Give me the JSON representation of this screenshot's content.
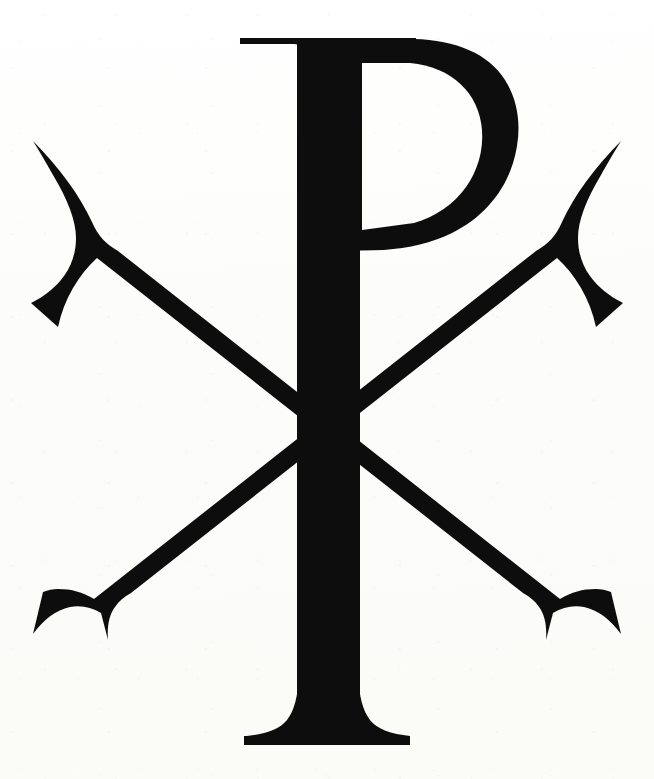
{
  "image": {
    "title": "Chi Rho (Christogram)",
    "alt_text": "Chi Rho monogram symbol",
    "background_color": "#fdfdfb",
    "ink_color": "#0d0d0d",
    "width": 654,
    "height": 779,
    "caption": ""
  },
  "glyph": {
    "name": "chi-rho",
    "description": "Serif Chi Rho monogram: letter P (rho) with vertical stem and bowl, overlaid by a diagonal X (chi) with flared concave serif terminals",
    "parts": [
      {
        "id": "chi-diagonal-nwse",
        "label": "Chi diagonal, upper-left to lower-right"
      },
      {
        "id": "chi-diagonal-nesw",
        "label": "Chi diagonal, upper-right to lower-left"
      },
      {
        "id": "rho-stem",
        "label": "Rho vertical stem"
      },
      {
        "id": "rho-bowl",
        "label": "Rho bowl"
      },
      {
        "id": "rho-top-serif",
        "label": "Rho top serif"
      },
      {
        "id": "rho-foot-serif",
        "label": "Rho foot serif"
      }
    ]
  },
  "geometry": {
    "chi_nwse": "M 34 141 L 49 137 L 92 214 L 120 250 L 560 597 L 584 617 L 622 634 L 615 644 L 566 615 L 553 640 L 541 633 L 558 600 L 118 255 L 92 268 L 58 300 L 48 293 L 80 256 L 92 228 Z",
    "chi_nesw": "M 620 141 L 606 137 L 562 214 L 534 250 L 94 597 L 70 617 L 33 634 L 40 644 L 88 615 L 101 640 L 113 633 L 96 600 L 536 255 L 562 268 L 596 300 L 606 293 L 574 256 L 562 228 Z",
    "rho_stem": "M 296 38 L 360 38 L 360 706 L 296 706 Z",
    "rho_bowl": "M 355 40 L 420 40 C 470 42 504 72 510 122 C 516 176 488 224 432 241 L 355 248 Z",
    "rho_bowl_counter": "M 360 62 L 413 62 C 452 66 480 90 483 128 C 486 168 462 208 420 222 L 360 228 Z",
    "rho_top_serif": "M 240 38 L 400 38 L 400 50 L 240 46 Z",
    "rho_foot_serif": "M 245 736 L 408 736 L 408 745 L 245 745 Z",
    "viewbox": "0 0 654 779"
  },
  "colors": {
    "ink": "#111111",
    "paper": "#fdfdfb"
  }
}
